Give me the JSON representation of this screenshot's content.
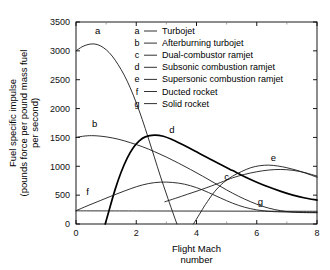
{
  "chart_data": {
    "type": "line",
    "title": "",
    "xlabel": "Flight Mach number",
    "ylabel": "Fuel specific impulse (pounds force per pound mass fuel per second)",
    "ylabel_line1": "Fuel specific impulse",
    "ylabel_line2": "(pounds force per pound mass fuel",
    "ylabel_line3": "per second)",
    "xlabel_line1": "Flight Mach",
    "xlabel_line2": "number",
    "xlim": [
      0,
      8
    ],
    "ylim": [
      0,
      3500
    ],
    "xticks": [
      0,
      2,
      4,
      6,
      8
    ],
    "xtick_labels": [
      "0",
      "2",
      "4",
      "6",
      "8"
    ],
    "xticks_minor": [
      1,
      3,
      5,
      7
    ],
    "yticks": [
      0,
      500,
      1000,
      1500,
      2000,
      2500,
      3000,
      3500
    ],
    "ytick_labels": [
      "0",
      "500",
      "1000",
      "1500",
      "2000",
      "2500",
      "3000",
      "3500"
    ],
    "grid": false,
    "legend_position": "upper-center-inside",
    "series": [
      {
        "key": "a",
        "name": "Turbojet",
        "emphasis": false,
        "label_x": 0.72,
        "label_y": 3300,
        "points": [
          [
            0.0,
            3000
          ],
          [
            0.2,
            3070
          ],
          [
            0.4,
            3110
          ],
          [
            0.6,
            3120
          ],
          [
            0.8,
            3090
          ],
          [
            1.0,
            3020
          ],
          [
            1.2,
            2910
          ],
          [
            1.4,
            2760
          ],
          [
            1.6,
            2580
          ],
          [
            1.8,
            2360
          ],
          [
            2.0,
            2100
          ],
          [
            2.2,
            1810
          ],
          [
            2.4,
            1490
          ],
          [
            2.6,
            1160
          ],
          [
            2.8,
            830
          ],
          [
            3.0,
            520
          ],
          [
            3.2,
            220
          ],
          [
            3.35,
            0
          ]
        ]
      },
      {
        "key": "b",
        "name": "Afterburning turbojet",
        "emphasis": false,
        "label_x": 0.62,
        "label_y": 1680,
        "points": [
          [
            0.0,
            1500
          ],
          [
            0.3,
            1525
          ],
          [
            0.6,
            1530
          ],
          [
            1.0,
            1510
          ],
          [
            1.4,
            1470
          ],
          [
            1.8,
            1410
          ],
          [
            2.2,
            1340
          ],
          [
            2.6,
            1255
          ],
          [
            3.0,
            1160
          ],
          [
            3.4,
            1055
          ],
          [
            3.8,
            945
          ],
          [
            4.2,
            830
          ],
          [
            4.6,
            710
          ],
          [
            5.0,
            590
          ],
          [
            5.4,
            480
          ],
          [
            5.8,
            385
          ],
          [
            6.2,
            305
          ],
          [
            6.6,
            250
          ],
          [
            7.0,
            215
          ],
          [
            7.4,
            200
          ],
          [
            8.0,
            195
          ]
        ]
      },
      {
        "key": "c",
        "name": "Dual-combustor ramjet",
        "emphasis": false,
        "label_x": 5.0,
        "label_y": 760,
        "points": [
          [
            2.95,
            385
          ],
          [
            3.3,
            445
          ],
          [
            3.7,
            515
          ],
          [
            4.1,
            585
          ],
          [
            4.5,
            660
          ],
          [
            4.9,
            740
          ],
          [
            5.2,
            800
          ],
          [
            5.6,
            860
          ],
          [
            6.0,
            905
          ],
          [
            6.4,
            935
          ],
          [
            6.8,
            945
          ],
          [
            7.2,
            930
          ],
          [
            7.6,
            890
          ],
          [
            8.0,
            830
          ]
        ]
      },
      {
        "key": "d",
        "name": "Subsonic combustion ramjet",
        "emphasis": true,
        "label_x": 3.18,
        "label_y": 1570,
        "points": [
          [
            0.97,
            0
          ],
          [
            1.1,
            240
          ],
          [
            1.3,
            600
          ],
          [
            1.5,
            900
          ],
          [
            1.7,
            1140
          ],
          [
            1.9,
            1320
          ],
          [
            2.1,
            1440
          ],
          [
            2.3,
            1510
          ],
          [
            2.6,
            1540
          ],
          [
            2.9,
            1520
          ],
          [
            3.2,
            1460
          ],
          [
            3.6,
            1360
          ],
          [
            4.0,
            1250
          ],
          [
            4.4,
            1140
          ],
          [
            4.8,
            1030
          ],
          [
            5.2,
            925
          ],
          [
            5.6,
            820
          ],
          [
            6.0,
            725
          ],
          [
            6.4,
            640
          ],
          [
            6.8,
            565
          ],
          [
            7.2,
            500
          ],
          [
            7.6,
            450
          ],
          [
            8.0,
            415
          ]
        ]
      },
      {
        "key": "e",
        "name": "Supersonic combustion ramjet",
        "emphasis": false,
        "label_x": 6.55,
        "label_y": 1100,
        "points": [
          [
            3.9,
            0
          ],
          [
            4.1,
            170
          ],
          [
            4.3,
            340
          ],
          [
            4.6,
            560
          ],
          [
            4.9,
            720
          ],
          [
            5.2,
            830
          ],
          [
            5.5,
            910
          ],
          [
            5.8,
            975
          ],
          [
            6.1,
            1010
          ],
          [
            6.4,
            1020
          ],
          [
            6.7,
            1005
          ],
          [
            7.0,
            975
          ],
          [
            7.3,
            935
          ],
          [
            7.6,
            885
          ],
          [
            8.0,
            810
          ]
        ]
      },
      {
        "key": "f",
        "name": "Ducted rocket",
        "emphasis": false,
        "label_x": 0.38,
        "label_y": 500,
        "points": [
          [
            0.0,
            230
          ],
          [
            0.4,
            320
          ],
          [
            0.8,
            405
          ],
          [
            1.2,
            490
          ],
          [
            1.6,
            570
          ],
          [
            2.0,
            645
          ],
          [
            2.4,
            700
          ],
          [
            2.8,
            725
          ],
          [
            3.2,
            720
          ],
          [
            3.6,
            690
          ],
          [
            4.0,
            630
          ],
          [
            4.4,
            545
          ],
          [
            4.8,
            450
          ],
          [
            5.2,
            360
          ],
          [
            5.6,
            290
          ],
          [
            6.0,
            245
          ],
          [
            6.4,
            220
          ],
          [
            6.8,
            210
          ],
          [
            7.4,
            205
          ],
          [
            8.0,
            200
          ]
        ]
      },
      {
        "key": "g",
        "name": "Solid rocket",
        "emphasis": false,
        "label_x": 6.12,
        "label_y": 330,
        "points": [
          [
            0.0,
            228
          ],
          [
            2.0,
            226
          ],
          [
            4.0,
            224
          ],
          [
            6.0,
            222
          ],
          [
            8.0,
            220
          ]
        ]
      }
    ],
    "legend": [
      {
        "key": "a",
        "label": "Turbojet"
      },
      {
        "key": "b",
        "label": "Afterburning turbojet"
      },
      {
        "key": "c",
        "label": "Dual-combustor ramjet"
      },
      {
        "key": "d",
        "label": "Subsonic combustion ramjet"
      },
      {
        "key": "e",
        "label": "Supersonic combustion ramjet"
      },
      {
        "key": "f",
        "label": "Ducted rocket"
      },
      {
        "key": "g",
        "label": "Solid rocket"
      }
    ],
    "colors": {
      "axis": "#000000",
      "curve": "#1a1a1a",
      "curve_emphasis": "#000000",
      "background": "#ffffff",
      "text": "#000000"
    }
  }
}
